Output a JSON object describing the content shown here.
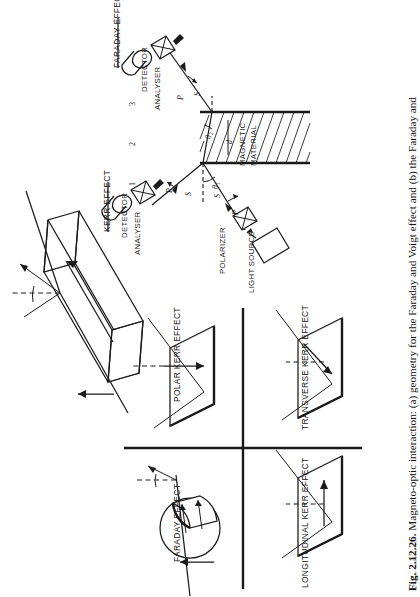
{
  "figure": {
    "number": "Fig. 2.12.26.",
    "caption_line1": "Magneto-optic interaction: (a) geometry for the Faraday and Voigt effect and (b) the Faraday and",
    "caption_line2_partial": "Kerr effects",
    "orientation": "rotated-90-ccw",
    "page_background": "#ffffff",
    "ink_color": "#1a1a1a"
  },
  "panel_a": {
    "title": "optical-geometry-diagram",
    "headers": {
      "kerr": "KERR EFFECT",
      "faraday": "FARADAY EFFECT"
    },
    "region_numbers": [
      "1",
      "2",
      "3"
    ],
    "material_label_line1": "MAGNETIC",
    "material_label_line2": "MATERIAL",
    "components": {
      "light_source": "LIGHT SOURCE",
      "polarizer": "POLARIZER",
      "analyser_kerr": "ANALYSER",
      "detector_kerr": "DETECTOR",
      "analyser_faraday": "ANALYSER",
      "detector_faraday": "DETECTOR"
    },
    "ray_labels": {
      "incident_p": "P",
      "incident_s": "S",
      "reflected_p": "P",
      "reflected_s": "S",
      "transmitted_p": "P",
      "transmitted_s": "S",
      "angle_incident": "θ₁",
      "angle_refracted": "θ₂",
      "thickness": "d"
    }
  },
  "panel_b": {
    "title": "four-quadrant-effects",
    "quadrants": [
      {
        "id": "faraday",
        "label": "FARADAY EFFECT",
        "position": "top-left",
        "geometry": "cylinder"
      },
      {
        "id": "polar-kerr",
        "label": "POLAR KERR EFFECT",
        "position": "top-right",
        "geometry": "plane"
      },
      {
        "id": "longitudinal-kerr",
        "label": "LONGITUDINAL KERR EFFECT",
        "position": "bottom-left",
        "geometry": "plane"
      },
      {
        "id": "transverse-kerr",
        "label": "TRANSVERSE KERR EFFECT",
        "position": "bottom-right",
        "geometry": "plane"
      }
    ]
  },
  "panel_c": {
    "title": "magnetised-block",
    "description": "rectangular block with in-plane magnetisation arrow, incident and reflected beams"
  }
}
